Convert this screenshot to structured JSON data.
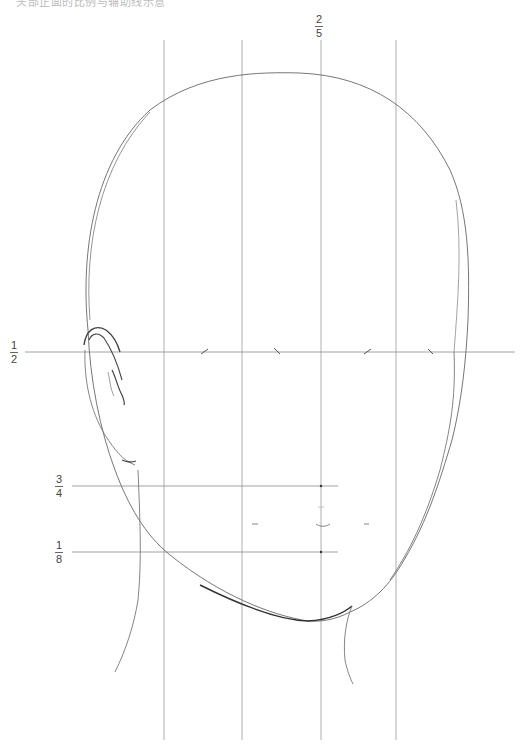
{
  "caption": {
    "text": "头部正面的比例与辅助线示意"
  },
  "labels": {
    "top_center": {
      "numerator": "2",
      "denominator": "5"
    },
    "eye_line": {
      "numerator": "1",
      "denominator": "2"
    },
    "nose_line": {
      "numerator": "3",
      "denominator": "4"
    },
    "mouth_line": {
      "numerator": "1",
      "denominator": "8"
    }
  },
  "guides": {
    "vertical_x": [
      164,
      242,
      320,
      395
    ],
    "eye_line_y": 352,
    "nose_line_y": 486,
    "mouth_line_y": 552
  },
  "colors": {
    "line": "#8a8a8a",
    "stroke": "#555555",
    "background": "#ffffff"
  }
}
